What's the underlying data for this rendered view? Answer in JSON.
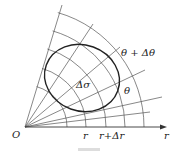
{
  "diagram": {
    "type": "polar coordinate area element",
    "labels": {
      "origin": "O",
      "r": "r",
      "r_plus_dr": "r+Δr",
      "axis": "r",
      "theta": "θ",
      "theta_plus_dtheta": "θ + Δθ",
      "area": "Δσ"
    },
    "colors": {
      "grid": "#444444",
      "region": "#222222",
      "background": "#ffffff"
    }
  }
}
